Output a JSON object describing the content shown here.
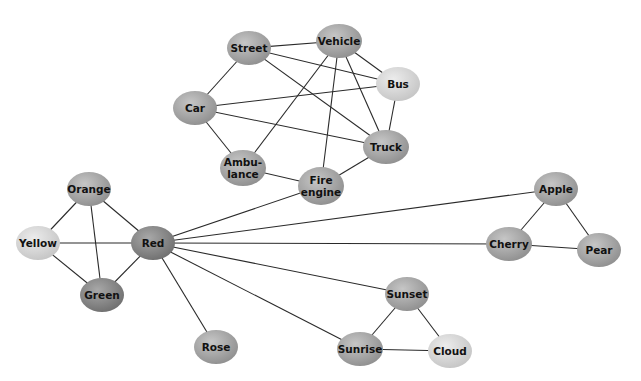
{
  "diagram": {
    "type": "semantic-network",
    "nodes": [
      {
        "id": "street",
        "label": "Street",
        "x": 249,
        "y": 48,
        "rx": 22,
        "ry": 17,
        "shade": "mid"
      },
      {
        "id": "vehicle",
        "label": "Vehicle",
        "x": 339,
        "y": 41,
        "rx": 23,
        "ry": 17,
        "shade": "mid"
      },
      {
        "id": "bus",
        "label": "Bus",
        "x": 398,
        "y": 84,
        "rx": 22,
        "ry": 17,
        "shade": "light"
      },
      {
        "id": "car",
        "label": "Car",
        "x": 195,
        "y": 108,
        "rx": 22,
        "ry": 17,
        "shade": "mid"
      },
      {
        "id": "truck",
        "label": "Truck",
        "x": 386,
        "y": 147,
        "rx": 23,
        "ry": 17,
        "shade": "mid"
      },
      {
        "id": "ambulance",
        "label": "Ambu-\nlance",
        "x": 243,
        "y": 168,
        "rx": 23,
        "ry": 18,
        "shade": "mid"
      },
      {
        "id": "fire-engine",
        "label": "Fire\nengine",
        "x": 321,
        "y": 186,
        "rx": 23,
        "ry": 19,
        "shade": "mid"
      },
      {
        "id": "orange",
        "label": "Orange",
        "x": 89,
        "y": 189,
        "rx": 22,
        "ry": 17,
        "shade": "mid"
      },
      {
        "id": "yellow",
        "label": "Yellow",
        "x": 38,
        "y": 243,
        "rx": 22,
        "ry": 17,
        "shade": "light"
      },
      {
        "id": "red",
        "label": "Red",
        "x": 153,
        "y": 243,
        "rx": 22,
        "ry": 17,
        "shade": "dark"
      },
      {
        "id": "green",
        "label": "Green",
        "x": 102,
        "y": 295,
        "rx": 22,
        "ry": 17,
        "shade": "dark"
      },
      {
        "id": "rose",
        "label": "Rose",
        "x": 216,
        "y": 347,
        "rx": 22,
        "ry": 17,
        "shade": "mid"
      },
      {
        "id": "apple",
        "label": "Apple",
        "x": 556,
        "y": 189,
        "rx": 22,
        "ry": 17,
        "shade": "mid"
      },
      {
        "id": "cherry",
        "label": "Cherry",
        "x": 509,
        "y": 244,
        "rx": 23,
        "ry": 17,
        "shade": "mid"
      },
      {
        "id": "pear",
        "label": "Pear",
        "x": 599,
        "y": 250,
        "rx": 22,
        "ry": 17,
        "shade": "mid"
      },
      {
        "id": "sunset",
        "label": "Sunset",
        "x": 407,
        "y": 294,
        "rx": 22,
        "ry": 17,
        "shade": "mid"
      },
      {
        "id": "sunrise",
        "label": "Sunrise",
        "x": 360,
        "y": 349,
        "rx": 23,
        "ry": 17,
        "shade": "mid"
      },
      {
        "id": "cloud",
        "label": "Cloud",
        "x": 450,
        "y": 351,
        "rx": 22,
        "ry": 17,
        "shade": "light"
      }
    ],
    "edges": [
      [
        "street",
        "vehicle"
      ],
      [
        "street",
        "bus"
      ],
      [
        "street",
        "truck"
      ],
      [
        "street",
        "car"
      ],
      [
        "vehicle",
        "bus"
      ],
      [
        "vehicle",
        "truck"
      ],
      [
        "vehicle",
        "ambulance"
      ],
      [
        "vehicle",
        "fire-engine"
      ],
      [
        "bus",
        "car"
      ],
      [
        "bus",
        "truck"
      ],
      [
        "car",
        "truck"
      ],
      [
        "car",
        "ambulance"
      ],
      [
        "ambulance",
        "fire-engine"
      ],
      [
        "truck",
        "fire-engine"
      ],
      [
        "fire-engine",
        "red"
      ],
      [
        "orange",
        "yellow"
      ],
      [
        "orange",
        "red"
      ],
      [
        "orange",
        "green"
      ],
      [
        "yellow",
        "red"
      ],
      [
        "yellow",
        "green"
      ],
      [
        "green",
        "red"
      ],
      [
        "red",
        "rose"
      ],
      [
        "red",
        "apple"
      ],
      [
        "red",
        "cherry"
      ],
      [
        "red",
        "sunset"
      ],
      [
        "red",
        "sunrise"
      ],
      [
        "apple",
        "cherry"
      ],
      [
        "apple",
        "pear"
      ],
      [
        "cherry",
        "pear"
      ],
      [
        "sunset",
        "sunrise"
      ],
      [
        "sunset",
        "cloud"
      ],
      [
        "sunrise",
        "cloud"
      ]
    ],
    "colors": {
      "light": [
        "#ececec",
        "#c4c4c4"
      ],
      "mid": [
        "#c6c6c6",
        "#8e8e8e"
      ],
      "dark": [
        "#a8a8a8",
        "#6e6e6e"
      ],
      "edge": "#2a2a2a"
    }
  }
}
